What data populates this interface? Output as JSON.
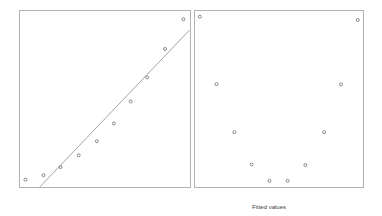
{
  "figure": {
    "xlabel": "Fitted values"
  },
  "colors": {
    "background": "#ffffff",
    "panel_border": "#b2b2b2",
    "point_stroke": "#6f6f6f",
    "fit_line": "#9a9a9a",
    "label_text": "#3d3d3d"
  },
  "chart_data": [
    {
      "type": "scatter",
      "name": "data-with-linear-fit",
      "title": "",
      "xlabel": "",
      "ylabel": "",
      "xlim": [
        0,
        1
      ],
      "ylim": [
        0,
        1
      ],
      "grid": false,
      "legend": false,
      "marker": "open-circle",
      "points": [
        [
          0.032,
          0.042
        ],
        [
          0.138,
          0.067
        ],
        [
          0.238,
          0.113
        ],
        [
          0.345,
          0.18
        ],
        [
          0.452,
          0.26
        ],
        [
          0.552,
          0.361
        ],
        [
          0.651,
          0.486
        ],
        [
          0.748,
          0.623
        ],
        [
          0.853,
          0.784
        ],
        [
          0.961,
          0.953
        ]
      ],
      "fit_line": {
        "x1": 0.116,
        "y1": 0.0,
        "x2": 0.997,
        "y2": 0.891
      }
    },
    {
      "type": "scatter",
      "name": "residuals-vs-fitted",
      "title": "",
      "xlabel": "Fitted values",
      "ylabel": "",
      "xlim": [
        0,
        1
      ],
      "ylim": [
        0,
        1
      ],
      "grid": false,
      "legend": false,
      "marker": "open-circle",
      "points": [
        [
          0.029,
          0.968
        ],
        [
          0.128,
          0.584
        ],
        [
          0.234,
          0.311
        ],
        [
          0.337,
          0.128
        ],
        [
          0.443,
          0.035
        ],
        [
          0.551,
          0.035
        ],
        [
          0.657,
          0.125
        ],
        [
          0.769,
          0.311
        ],
        [
          0.869,
          0.583
        ],
        [
          0.969,
          0.949
        ]
      ],
      "fit_line": null
    }
  ]
}
